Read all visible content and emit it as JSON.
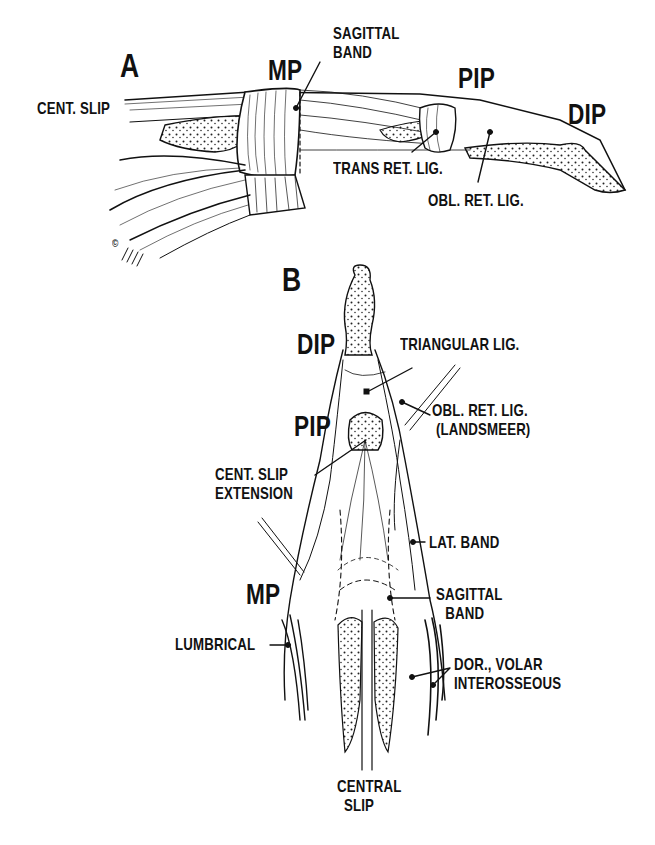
{
  "figure": {
    "panel_a": {
      "panel_letter": "A",
      "labels": {
        "mp": "MP",
        "pip": "PIP",
        "dip": "DIP",
        "cent_slip": "CENT. SLIP",
        "sagittal_band_line1": "SAGITTAL",
        "sagittal_band_line2": "BAND",
        "trans_ret_lig": "TRANS RET. LIG.",
        "obl_ret_lig": "OBL. RET. LIG."
      },
      "signature": "©"
    },
    "panel_b": {
      "panel_letter": "B",
      "labels": {
        "dip": "DIP",
        "pip": "PIP",
        "mp": "MP",
        "triangular_lig": "TRIANGULAR LIG.",
        "obl_ret_lig_line1": "OBL. RET. LIG.",
        "obl_ret_lig_line2": "(LANDSMEER)",
        "cent_slip_ext_line1": "CENT. SLIP",
        "cent_slip_ext_line2": "EXTENSION",
        "lat_band": "LAT. BAND",
        "sagittal_band_line1": "SAGITTAL",
        "sagittal_band_line2": "BAND",
        "lumbrical": "LUMBRICAL",
        "interosseous_line1": "DOR., VOLAR",
        "interosseous_line2": "INTEROSSEOUS",
        "central_slip_line1": "CENTRAL",
        "central_slip_line2": "SLIP"
      }
    }
  }
}
